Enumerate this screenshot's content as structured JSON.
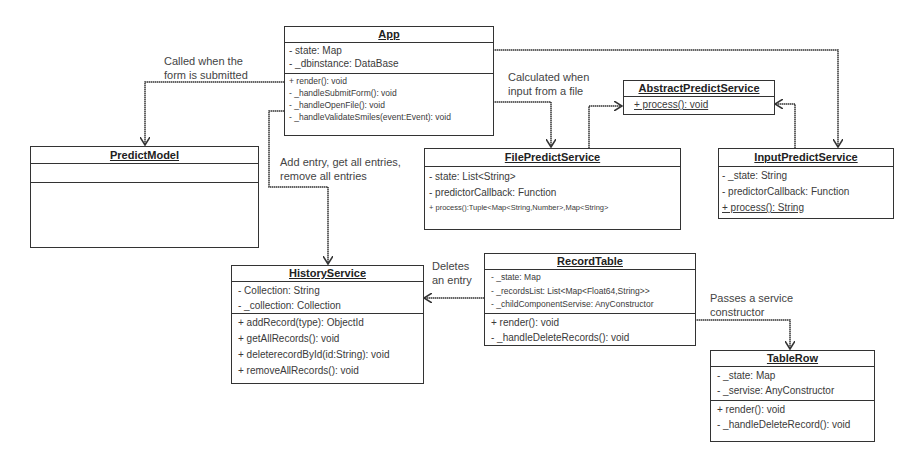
{
  "diagram": {
    "type": "UML class diagram",
    "classes": {
      "app": {
        "name": "App",
        "attributes": [
          "- state: Map",
          "- _dbinstance: DataBase"
        ],
        "methods": [
          "+ render(): void",
          "- _handleSubmitForm(): void",
          "- _handleOpenFile(): void",
          "- _handleValidateSmiles(event:Event): void"
        ]
      },
      "predict_model": {
        "name": "PredictModel",
        "attributes": [],
        "methods": []
      },
      "abstract_predict_service": {
        "name": "AbstractPredictService",
        "methods": [
          "+ process(): void"
        ]
      },
      "file_predict_service": {
        "name": "FilePredictService",
        "attributes": [
          "- state: List<String>",
          "- predictorCallback: Function",
          "+ process():Tuple<Map<String,Number>,Map<String>"
        ]
      },
      "input_predict_service": {
        "name": "InputPredictService",
        "attributes": [
          "- _state: String",
          "- predictorCallback: Function",
          "+ process(): String"
        ]
      },
      "history_service": {
        "name": "HistoryService",
        "attributes": [
          "- Collection: String",
          "- _collection: Collection"
        ],
        "methods": [
          "+ addRecord(type): ObjectId",
          "+ getAllRecords(): void",
          "+ deleterecordById(id:String): void",
          "+ removeAllRecords(): void"
        ]
      },
      "record_table": {
        "name": "RecordTable",
        "attributes": [
          "- _state: Map",
          "- _recordsList: List<Map<Float64,String>>",
          "- _childComponentServise: AnyConstructor"
        ],
        "methods": [
          "+ render(): void",
          "- _handleDeleteRecords(): void"
        ]
      },
      "table_row": {
        "name": "TableRow",
        "attributes": [
          "- _state: Map",
          "- _servise: AnyConstructor"
        ],
        "methods": [
          "+ render(): void",
          "- _handleDeleteRecord(): void"
        ]
      }
    },
    "edge_labels": {
      "app_to_predict_model": [
        "Called when the",
        "form is submitted"
      ],
      "app_to_file_predict": [
        "Calculated when",
        "input from a file"
      ],
      "app_to_history": [
        "Add entry, get all entries,",
        "remove all entries"
      ],
      "record_table_to_history": [
        "Deletes",
        "an entry"
      ],
      "record_table_to_table_row": [
        "Passes a service",
        "constructor"
      ]
    },
    "colors": {
      "line": "#333333",
      "text": "#3a3a3a",
      "background": "#ffffff"
    }
  }
}
